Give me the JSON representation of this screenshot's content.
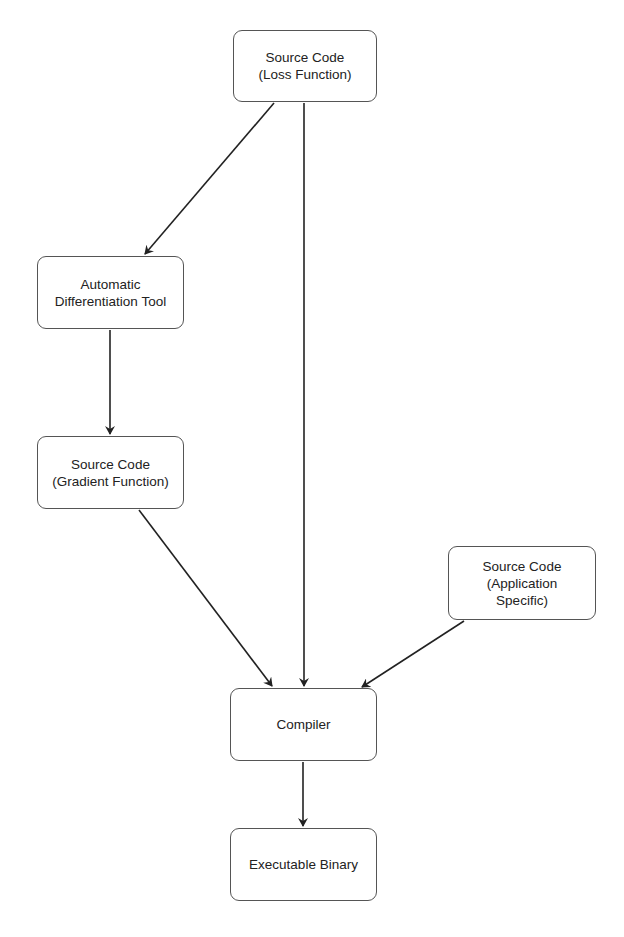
{
  "diagram": {
    "type": "flowchart",
    "colors": {
      "stroke": "#555555",
      "arrow": "#222222",
      "text": "#222222",
      "background": "#ffffff"
    },
    "nodes": [
      {
        "id": "loss",
        "label": "Source Code\n(Loss Function)",
        "x": 233,
        "y": 30,
        "w": 144,
        "h": 72
      },
      {
        "id": "adtool",
        "label": "Automatic\nDifferentiation Tool",
        "x": 37,
        "y": 256,
        "w": 147,
        "h": 73
      },
      {
        "id": "gradient",
        "label": "Source Code\n(Gradient Function)",
        "x": 37,
        "y": 436,
        "w": 147,
        "h": 73
      },
      {
        "id": "app",
        "label": "Source Code\n(Application\nSpecific)",
        "x": 448,
        "y": 546,
        "w": 148,
        "h": 74
      },
      {
        "id": "compiler",
        "label": "Compiler",
        "x": 230,
        "y": 688,
        "w": 147,
        "h": 73
      },
      {
        "id": "binary",
        "label": "Executable Binary",
        "x": 230,
        "y": 828,
        "w": 147,
        "h": 73
      }
    ],
    "edges": [
      {
        "from": "loss",
        "to": "adtool",
        "x1": 274,
        "y1": 103,
        "x2": 145,
        "y2": 254
      },
      {
        "from": "loss",
        "to": "compiler",
        "x1": 304,
        "y1": 103,
        "x2": 304,
        "y2": 686
      },
      {
        "from": "adtool",
        "to": "gradient",
        "x1": 110,
        "y1": 330,
        "x2": 110,
        "y2": 434
      },
      {
        "from": "gradient",
        "to": "compiler",
        "x1": 139,
        "y1": 510,
        "x2": 272,
        "y2": 686
      },
      {
        "from": "app",
        "to": "compiler",
        "x1": 464,
        "y1": 621,
        "x2": 362,
        "y2": 687
      },
      {
        "from": "compiler",
        "to": "binary",
        "x1": 303,
        "y1": 762,
        "x2": 303,
        "y2": 826
      }
    ]
  }
}
